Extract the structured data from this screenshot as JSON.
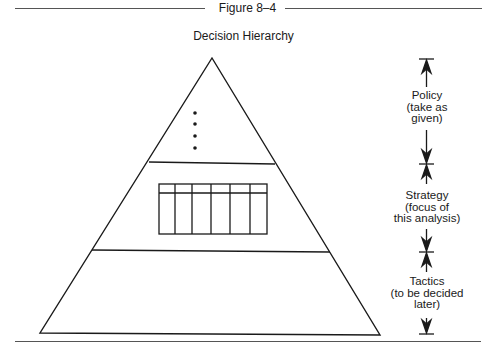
{
  "figure": {
    "label": "Figure 8–4",
    "title": "Decision Hierarchy"
  },
  "pyramid": {
    "levels": [
      {
        "name": "policy",
        "content": "ellipsis-dots"
      },
      {
        "name": "strategy",
        "content": "table-grid",
        "columns": 6,
        "header_rows": 1
      },
      {
        "name": "tactics",
        "content": "empty"
      }
    ]
  },
  "side_labels": {
    "policy": {
      "line1": "Policy",
      "line2": "(take as",
      "line3": "given)"
    },
    "strategy": {
      "line1": "Strategy",
      "line2": "(focus of",
      "line3": "this analysis)"
    },
    "tactics": {
      "line1": "Tactics",
      "line2": "(to be decided",
      "line3": "later)"
    }
  },
  "colors": {
    "line": "#1a1a1a",
    "rule": "#555555",
    "background": "#ffffff"
  }
}
